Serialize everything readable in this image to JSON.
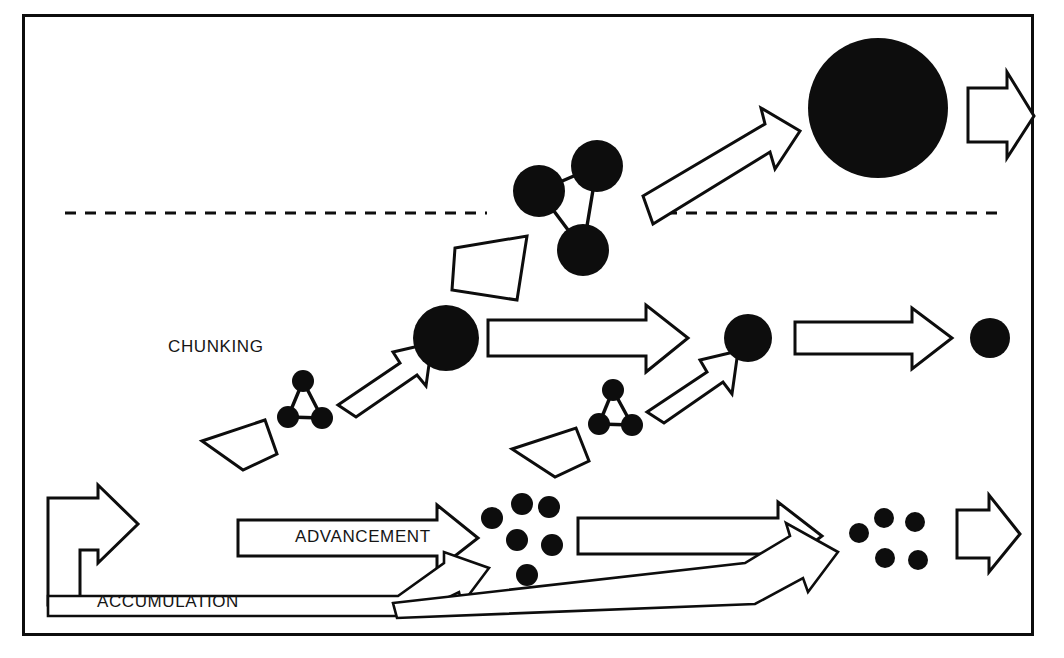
{
  "figure": {
    "background_color": "#ffffff",
    "ink_color": "#0d0d0d",
    "width": 1064,
    "height": 658,
    "border": {
      "x": 23,
      "y": 15,
      "width": 1010,
      "height": 620
    }
  },
  "labels": {
    "chunking": "CHUNKING",
    "advancement": "ADVANCEMENT",
    "accumulation": "ACCUMULATION"
  },
  "dashed_separators": [
    {
      "name": "dashed-line-left",
      "x1": 65,
      "y1": 213,
      "x2": 487,
      "y2": 213
    },
    {
      "name": "dashed-line-right",
      "x1": 666,
      "y1": 213,
      "x2": 1002,
      "y2": 213
    }
  ],
  "rows": {
    "top": {
      "name": "top-row",
      "description": "Three linked large nodes chunk into one very large filled circle",
      "cluster": {
        "name": "triangle-cluster-large",
        "node_radius": 26,
        "nodes": [
          {
            "cx": 539,
            "cy": 191
          },
          {
            "cx": 597,
            "cy": 166
          },
          {
            "cx": 583,
            "cy": 250
          }
        ],
        "links": [
          [
            0,
            1
          ],
          [
            1,
            2
          ],
          [
            0,
            2
          ]
        ]
      },
      "arrow": {
        "name": "chunking-arrow-top",
        "direction": "up-right"
      },
      "result_circle": {
        "name": "mega-circle",
        "cx": 878,
        "cy": 108,
        "r": 70
      },
      "output_arrow": {
        "name": "output-arrow-top",
        "direction": "right"
      }
    },
    "middle": {
      "name": "middle-row",
      "description": "Small triangle clusters chunk into progressively smaller filled circles",
      "clusters": [
        {
          "name": "triangle-cluster-small-1",
          "node_radius": 11,
          "nodes": [
            {
              "cx": 303,
              "cy": 381
            },
            {
              "cx": 288,
              "cy": 417
            },
            {
              "cx": 322,
              "cy": 418
            }
          ]
        },
        {
          "name": "triangle-cluster-small-2",
          "node_radius": 11,
          "nodes": [
            {
              "cx": 613,
              "cy": 390
            },
            {
              "cx": 599,
              "cy": 424
            },
            {
              "cx": 632,
              "cy": 425
            }
          ]
        }
      ],
      "circles": [
        {
          "name": "middle-circle-1",
          "cx": 446,
          "cy": 338,
          "r": 33
        },
        {
          "name": "middle-circle-2",
          "cx": 748,
          "cy": 338,
          "r": 24
        },
        {
          "name": "middle-circle-3",
          "cx": 990,
          "cy": 338,
          "r": 20
        }
      ],
      "arrows": [
        {
          "name": "chunking-arrow-mid-1",
          "direction": "up-right"
        },
        {
          "name": "advancement-arrow-mid-1",
          "direction": "right"
        },
        {
          "name": "chunking-arrow-mid-2",
          "direction": "up-right"
        },
        {
          "name": "advancement-arrow-mid-2",
          "direction": "right"
        }
      ]
    },
    "bottom": {
      "name": "bottom-row",
      "description": "Loose dots advance and accumulate, feeding back to the start",
      "dot_groups": [
        {
          "name": "dot-cluster-left",
          "count": 6,
          "dot_radius": 11,
          "dots": [
            {
              "cx": 492,
              "cy": 518
            },
            {
              "cx": 522,
              "cy": 504
            },
            {
              "cx": 549,
              "cy": 507
            },
            {
              "cx": 517,
              "cy": 540
            },
            {
              "cx": 552,
              "cy": 545
            },
            {
              "cx": 527,
              "cy": 575
            }
          ]
        },
        {
          "name": "dot-cluster-right",
          "count": 5,
          "dot_radius": 10,
          "dots": [
            {
              "cx": 859,
              "cy": 533
            },
            {
              "cx": 884,
              "cy": 518
            },
            {
              "cx": 915,
              "cy": 522
            },
            {
              "cx": 885,
              "cy": 558
            },
            {
              "cx": 918,
              "cy": 560
            }
          ]
        }
      ],
      "arrows": [
        {
          "name": "advancement-arrow-1",
          "direction": "right",
          "label": "ADVANCEMENT"
        },
        {
          "name": "advancement-arrow-2",
          "direction": "right"
        },
        {
          "name": "output-arrow-bottom",
          "direction": "right"
        },
        {
          "name": "accumulation-arrow-1",
          "direction": "up-right"
        },
        {
          "name": "accumulation-arrow-2",
          "direction": "up-right"
        },
        {
          "name": "feedback-arrow-left",
          "direction": "right"
        }
      ]
    }
  }
}
